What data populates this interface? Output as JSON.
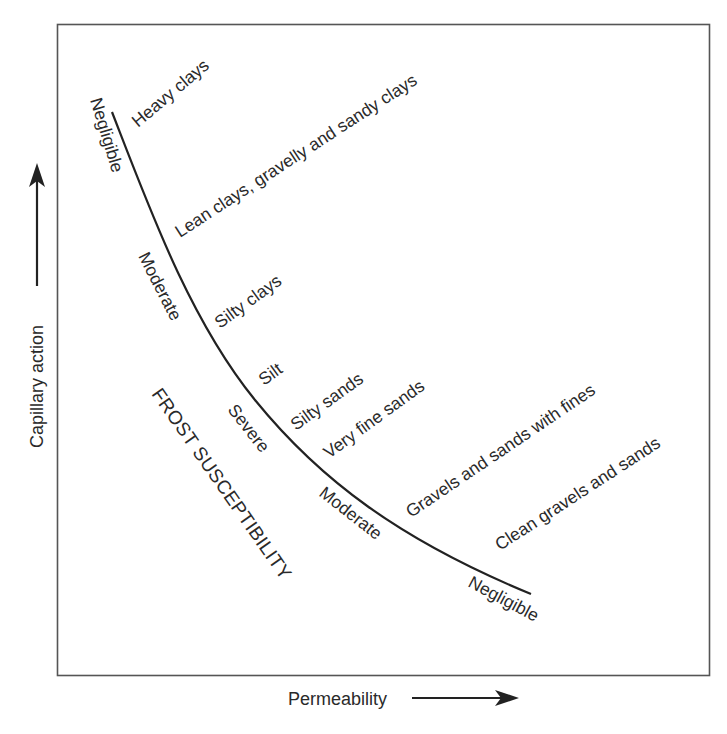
{
  "diagram": {
    "type": "conceptual-curve",
    "axes": {
      "y_label": "Capillary action",
      "x_label": "Permeability"
    },
    "region_label": "FROST SUSCEPTIBILITY",
    "susceptibility_levels_along_curve": [
      "Negligible",
      "Moderate",
      "Severe",
      "Moderate",
      "Negligible"
    ],
    "soil_types": [
      "Heavy clays",
      "Lean clays, gravelly and sandy clays",
      "Silty clays",
      "Silt",
      "Silty sands",
      "Very fine sands",
      "Gravels and sands with fines",
      "Clean gravels and sands"
    ],
    "colors": {
      "line": "#222222",
      "text": "#2a2a2a",
      "frame": "#555555",
      "background": "#ffffff"
    }
  }
}
